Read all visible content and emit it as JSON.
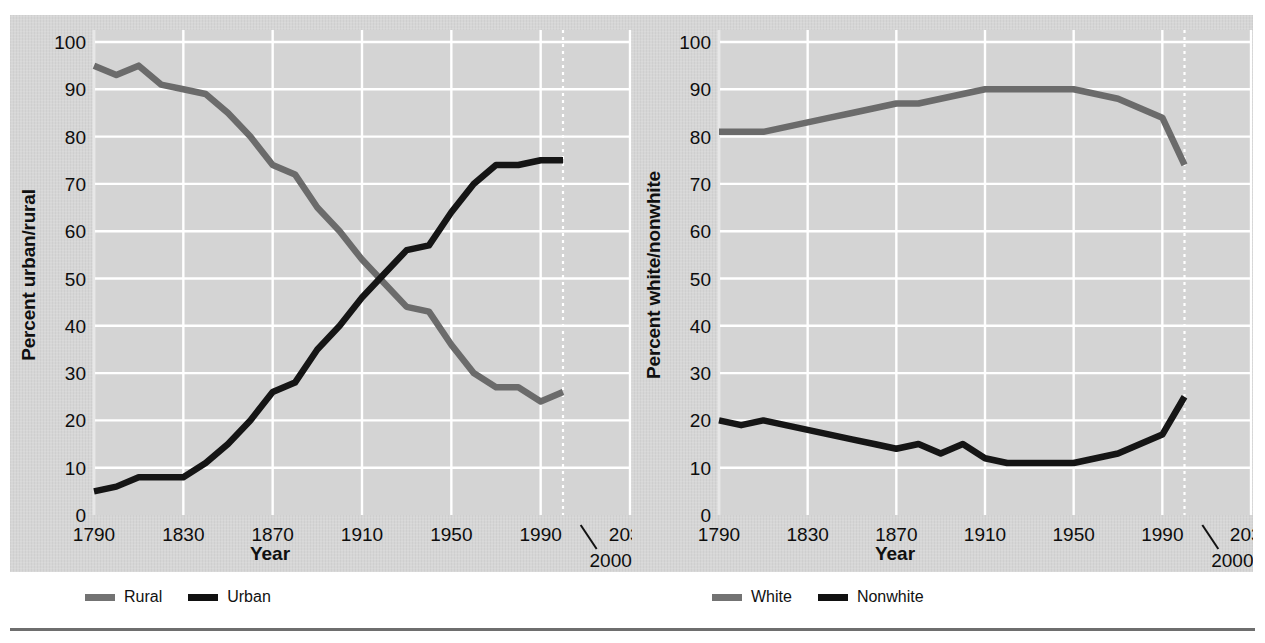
{
  "figure": {
    "background_panel_color": "#d6d6d6",
    "page_background": "#ffffff",
    "rule_color": "#6e6e6e",
    "series_gray": "#6b6b6b",
    "series_black": "#151515",
    "gridline_color": "#ffffff"
  },
  "charts": [
    {
      "id": "urban-rural",
      "ylabel": "Percent urban/rural",
      "xlabel": "Year",
      "ytick_labels": [
        "0",
        "10",
        "20",
        "30",
        "40",
        "50",
        "60",
        "70",
        "80",
        "90",
        "100"
      ],
      "xtick_labels": [
        "1790",
        "1830",
        "1870",
        "1910",
        "1950",
        "1990",
        "2030"
      ],
      "xtick_extra_label": "2000",
      "legend": [
        {
          "label": "Rural",
          "color": "#6b6b6b",
          "key": "rural"
        },
        {
          "label": "Urban",
          "color": "#151515",
          "key": "urban"
        }
      ]
    },
    {
      "id": "white-nonwhite",
      "ylabel": "Percent white/nonwhite",
      "xlabel": "Year",
      "ytick_labels": [
        "0",
        "10",
        "20",
        "30",
        "40",
        "50",
        "60",
        "70",
        "80",
        "90",
        "100"
      ],
      "xtick_labels": [
        "1790",
        "1830",
        "1870",
        "1910",
        "1950",
        "1990",
        "2030"
      ],
      "xtick_extra_label": "2000",
      "legend": [
        {
          "label": "White",
          "color": "#6b6b6b",
          "key": "white"
        },
        {
          "label": "Nonwhite",
          "color": "#151515",
          "key": "nonwhite"
        }
      ]
    }
  ],
  "chart_data": [
    {
      "type": "line",
      "title": "",
      "xlabel": "Year",
      "ylabel": "Percent urban/rural",
      "xlim": [
        1790,
        2030
      ],
      "ylim": [
        0,
        100
      ],
      "xticks": [
        1790,
        1830,
        1870,
        1910,
        1950,
        1990,
        2030
      ],
      "xtick_labels": [
        "1790",
        "1830",
        "1870",
        "1910",
        "1950",
        "1990",
        "2030"
      ],
      "yticks": [
        0,
        10,
        20,
        30,
        40,
        50,
        60,
        70,
        80,
        90,
        100
      ],
      "grid": true,
      "legend_position": "below",
      "x": [
        1790,
        1800,
        1810,
        1820,
        1830,
        1840,
        1850,
        1860,
        1870,
        1880,
        1890,
        1900,
        1910,
        1920,
        1930,
        1940,
        1950,
        1960,
        1970,
        1980,
        1990,
        2000
      ],
      "series": [
        {
          "name": "Rural",
          "color": "#6b6b6b",
          "values": [
            95,
            93,
            95,
            91,
            90,
            89,
            85,
            80,
            74,
            72,
            65,
            60,
            54,
            49,
            44,
            43,
            36,
            30,
            27,
            27,
            24,
            26
          ]
        },
        {
          "name": "Urban",
          "color": "#151515",
          "values": [
            5,
            6,
            8,
            8,
            8,
            11,
            15,
            20,
            26,
            28,
            35,
            40,
            46,
            51,
            56,
            57,
            64,
            70,
            74,
            74,
            75,
            75
          ]
        }
      ]
    },
    {
      "type": "line",
      "title": "",
      "xlabel": "Year",
      "ylabel": "Percent white/nonwhite",
      "xlim": [
        1790,
        2030
      ],
      "ylim": [
        0,
        100
      ],
      "xticks": [
        1790,
        1830,
        1870,
        1910,
        1950,
        1990,
        2030
      ],
      "xtick_labels": [
        "1790",
        "1830",
        "1870",
        "1910",
        "1950",
        "1990",
        "2030"
      ],
      "yticks": [
        0,
        10,
        20,
        30,
        40,
        50,
        60,
        70,
        80,
        90,
        100
      ],
      "grid": true,
      "legend_position": "below",
      "x": [
        1790,
        1800,
        1810,
        1820,
        1830,
        1840,
        1850,
        1860,
        1870,
        1880,
        1890,
        1900,
        1910,
        1920,
        1930,
        1940,
        1950,
        1960,
        1970,
        1980,
        1990,
        2000
      ],
      "series": [
        {
          "name": "White",
          "color": "#6b6b6b",
          "values": [
            81,
            81,
            81,
            82,
            83,
            84,
            85,
            86,
            87,
            87,
            88,
            89,
            90,
            90,
            90,
            90,
            90,
            89,
            88,
            86,
            84,
            74
          ]
        },
        {
          "name": "Nonwhite",
          "color": "#151515",
          "values": [
            20,
            19,
            20,
            19,
            18,
            17,
            16,
            15,
            14,
            15,
            13,
            15,
            12,
            11,
            11,
            11,
            11,
            12,
            13,
            15,
            17,
            25
          ]
        }
      ]
    }
  ]
}
